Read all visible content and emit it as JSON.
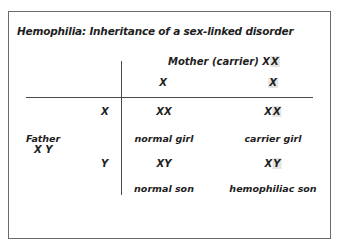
{
  "diagram": {
    "title": "Hemophilia: Inheritance of a sex-linked disorder",
    "mother": {
      "label": "Mother (carrier)",
      "genotype_a": "X",
      "genotype_b": "X",
      "alleles": [
        "X",
        "X"
      ]
    },
    "father": {
      "label": "Father",
      "genotype": "X Y",
      "alleles": [
        "X",
        "Y"
      ]
    },
    "cells": [
      {
        "genotype_a": "X",
        "genotype_b": "X",
        "label": "normal girl"
      },
      {
        "genotype_a": "X",
        "genotype_b": "X",
        "label": "carrier girl"
      },
      {
        "genotype_a": "X",
        "genotype_b": "Y",
        "label": "normal son"
      },
      {
        "genotype_a": "X",
        "genotype_b": "Y",
        "label": "hemophiliac son"
      }
    ],
    "highlight_color": "#e4e4e4",
    "line_color": "#4a4a4a",
    "border_color": "#6b6b6b"
  }
}
